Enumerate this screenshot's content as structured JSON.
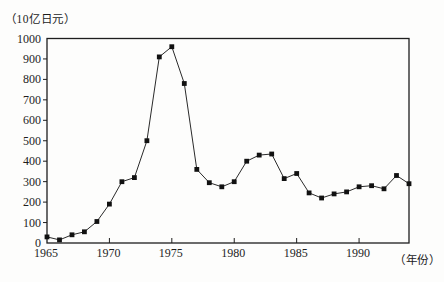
{
  "figure": {
    "background": "#fdfdfc",
    "ink_color": "#1e1e1e"
  },
  "chart_data": {
    "type": "line",
    "marker": "filled-square",
    "line_color": "#2a2a2a",
    "marker_color": "#111111",
    "ylabel": "（10亿日元）",
    "xlabel": "（年份）",
    "title": "",
    "xlim": [
      1965,
      1994
    ],
    "ylim": [
      0,
      1000
    ],
    "grid": false,
    "legend": "none",
    "x": [
      1965,
      1966,
      1967,
      1968,
      1969,
      1970,
      1971,
      1972,
      1973,
      1974,
      1975,
      1976,
      1977,
      1978,
      1979,
      1980,
      1981,
      1982,
      1983,
      1984,
      1985,
      1986,
      1987,
      1988,
      1989,
      1990,
      1991,
      1992,
      1993,
      1994
    ],
    "values": [
      30,
      15,
      40,
      55,
      105,
      190,
      300,
      320,
      500,
      910,
      960,
      780,
      360,
      295,
      275,
      300,
      400,
      430,
      435,
      315,
      340,
      245,
      220,
      240,
      250,
      275,
      280,
      265,
      330,
      290
    ],
    "yticks": [
      0,
      100,
      200,
      300,
      400,
      500,
      600,
      700,
      800,
      900,
      1000
    ],
    "xtick_labels": [
      1965,
      1970,
      1975,
      1980,
      1985,
      1990
    ],
    "xtick_marks": [
      1970,
      1975,
      1980,
      1985,
      1990
    ]
  }
}
